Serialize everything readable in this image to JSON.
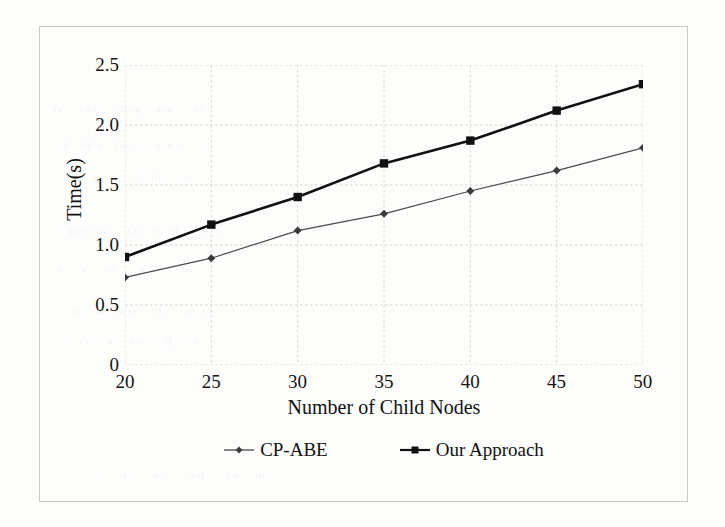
{
  "chart_data": {
    "type": "line",
    "title": "",
    "xlabel": "Number of Child Nodes",
    "ylabel": "Time(s)",
    "x": [
      20,
      25,
      30,
      35,
      40,
      45,
      50
    ],
    "xtick_labels": [
      "20",
      "25",
      "30",
      "35",
      "40",
      "45",
      "50"
    ],
    "ytick_labels": [
      "2.5",
      "2.0",
      "1.5",
      "1.0",
      "0.5",
      "0"
    ],
    "ytick_values": [
      2.5,
      2.0,
      1.5,
      1.0,
      0.5,
      0
    ],
    "xlim": [
      20,
      50
    ],
    "ylim": [
      0,
      2.5
    ],
    "grid": true,
    "legend_position": "bottom-center",
    "series": [
      {
        "name": "CP-ABE",
        "values": [
          0.73,
          0.89,
          1.12,
          1.26,
          1.45,
          1.62,
          1.81
        ],
        "color": "#4a4a4a",
        "marker": "diamond",
        "line_width": 1.2
      },
      {
        "name": "Our Approach",
        "values": [
          0.9,
          1.17,
          1.4,
          1.68,
          1.87,
          2.12,
          2.34
        ],
        "color": "#111111",
        "marker": "square",
        "line_width": 2.6
      }
    ]
  },
  "legend": {
    "items": [
      {
        "label": "CP-ABE"
      },
      {
        "label": "Our Approach"
      }
    ]
  }
}
